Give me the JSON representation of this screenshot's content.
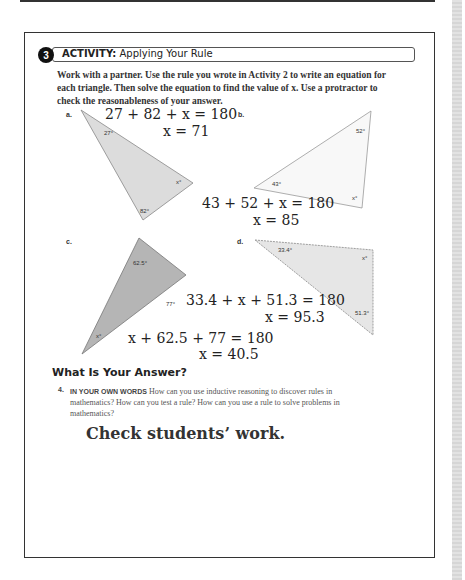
{
  "activity": {
    "number": "3",
    "label": "ACTIVITY:",
    "title": "Applying Your Rule",
    "instructions": "Work with a partner. Use the rule you wrote in Activity 2 to write an equation for each triangle. Then solve the equation to find the value of x. Use a protractor to check the reasonableness of your answer."
  },
  "problems": [
    {
      "label": "a.",
      "angles": [
        "27°",
        "82°",
        "x°"
      ],
      "equation": "27 + 82 + x = 180",
      "solution": "x = 71"
    },
    {
      "label": "b.",
      "angles": [
        "52°",
        "43°",
        "x°"
      ],
      "equation": "43 + 52 + x = 180",
      "solution": "x = 85"
    },
    {
      "label": "c.",
      "angles": [
        "62.5°",
        "77°",
        "x°"
      ],
      "equation": "x + 62.5 + 77 = 180",
      "solution": "x = 40.5"
    },
    {
      "label": "d.",
      "angles": [
        "33.4°",
        "x°",
        "51.3°"
      ],
      "equation": "33.4 + x + 51.3 = 180",
      "solution": "x = 95.3"
    }
  ],
  "answer": {
    "heading": "What Is Your Answer?",
    "question_number": "4.",
    "question_keyword": "IN YOUR OWN WORDS",
    "question_text": " How can you use inductive reasoning to discover rules in mathematics? How can you test a rule? How can you use a rule to solve problems in mathematics?",
    "response": "Check students’ work."
  }
}
